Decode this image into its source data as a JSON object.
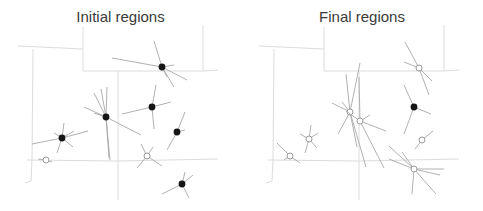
{
  "panels": [
    {
      "title": "Initial regions",
      "centers": [
        {
          "type": "filled",
          "x": 162,
          "y": 67,
          "spokes": [
            [
              -8,
              -26
            ],
            [
              -50,
              -9
            ],
            [
              12,
              -2
            ],
            [
              25,
              13
            ],
            [
              12,
              20
            ],
            [
              5,
              10
            ]
          ]
        },
        {
          "type": "filled",
          "x": 106,
          "y": 117,
          "spokes": [
            [
              -12,
              -24
            ],
            [
              -5,
              -28
            ],
            [
              1,
              -30
            ],
            [
              -22,
              -10
            ],
            [
              -12,
              -4
            ],
            [
              3,
              41
            ],
            [
              4,
              43
            ],
            [
              35,
              18
            ]
          ]
        },
        {
          "type": "filled",
          "x": 152,
          "y": 107,
          "spokes": [
            [
              -30,
              7
            ],
            [
              19,
              -5
            ],
            [
              4,
              -22
            ],
            [
              2,
              22
            ]
          ]
        },
        {
          "type": "filled",
          "x": 62,
          "y": 138,
          "spokes": [
            [
              -30,
              6
            ],
            [
              26,
              -7
            ],
            [
              2,
              -15
            ],
            [
              -5,
              15
            ],
            [
              12,
              -7
            ],
            [
              11,
              9
            ],
            [
              -8,
              -5
            ]
          ]
        },
        {
          "type": "filled",
          "x": 177,
          "y": 132,
          "spokes": [
            [
              8,
              -20
            ],
            [
              8,
              -2
            ],
            [
              -10,
              18
            ]
          ]
        },
        {
          "type": "filled",
          "x": 182,
          "y": 184,
          "spokes": [
            [
              -20,
              10
            ],
            [
              11,
              -9
            ],
            [
              3,
              -12
            ],
            [
              7,
              14
            ]
          ]
        }
      ],
      "hollow": [
        {
          "x": 46,
          "y": 160,
          "spokes": [
            [
              -8,
              -1
            ],
            [
              6,
              2
            ]
          ]
        },
        {
          "x": 147,
          "y": 156,
          "spokes": [
            [
              -6,
              -12
            ],
            [
              6,
              -9
            ],
            [
              -10,
              12
            ],
            [
              15,
              10
            ]
          ]
        }
      ]
    },
    {
      "title": "Final regions",
      "centers": [
        {
          "type": "filled",
          "x": 414,
          "y": 107,
          "spokes": [
            [
              -10,
              -22
            ],
            [
              17,
              7
            ],
            [
              -10,
              27
            ]
          ]
        }
      ],
      "hollow": [
        {
          "x": 419,
          "y": 68,
          "spokes": [
            [
              -14,
              -26
            ],
            [
              -15,
              -6
            ],
            [
              13,
              13
            ],
            [
              10,
              27
            ]
          ]
        },
        {
          "x": 350,
          "y": 112,
          "spokes": [
            [
              -18,
              -9
            ],
            [
              -12,
              22
            ],
            [
              10,
              -49
            ],
            [
              -4,
              -38
            ],
            [
              -8,
              -10
            ],
            [
              16,
              55
            ],
            [
              7,
              35
            ]
          ]
        },
        {
          "x": 360,
          "y": 121,
          "spokes": [
            [
              -14,
              -10
            ],
            [
              26,
              10
            ],
            [
              10,
              -6
            ],
            [
              24,
              47
            ],
            [
              -1,
              -44
            ]
          ]
        },
        {
          "x": 309,
          "y": 139,
          "spokes": [
            [
              -9,
              -5
            ],
            [
              9,
              -6
            ],
            [
              8,
              9
            ],
            [
              -4,
              14
            ],
            [
              2,
              -14
            ]
          ]
        },
        {
          "x": 290,
          "y": 156,
          "spokes": [
            [
              -13,
              -13
            ],
            [
              10,
              7
            ],
            [
              -6,
              4
            ]
          ]
        },
        {
          "x": 422,
          "y": 140,
          "spokes": [
            [
              11,
              -9
            ],
            [
              -7,
              9
            ]
          ]
        },
        {
          "x": 414,
          "y": 169,
          "spokes": [
            [
              -25,
              -23
            ],
            [
              -25,
              -10
            ],
            [
              -12,
              -17
            ],
            [
              26,
              6
            ],
            [
              30,
              0
            ],
            [
              22,
              25
            ],
            [
              -2,
              25
            ]
          ]
        }
      ]
    }
  ],
  "colors": {
    "outline": "#dcdcdc",
    "spoke": "#a8a8a8",
    "dot_filled": "#151515",
    "dot_hollow_stroke": "#9a9a9a",
    "title": "#3a3a3a"
  }
}
